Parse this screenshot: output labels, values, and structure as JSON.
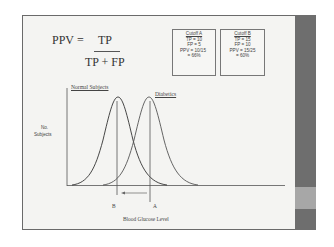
{
  "formula": {
    "lhs": "PPV",
    "equals": "=",
    "numerator": "TP",
    "denominator": "TP + FP"
  },
  "cutoff_a": {
    "title": "Cutoff A",
    "tp": "TP = 10",
    "fp": "FP = 5",
    "ppv": "PPV = 10/15",
    "result": "= 66%"
  },
  "cutoff_b": {
    "title": "Cutoff B",
    "tp": "TP = 15",
    "fp": "FP = 10",
    "ppv": "PPV = 15/25",
    "result": "= 60%"
  },
  "chart": {
    "series_normal": "Normal Subjects",
    "series_diabetics": "Diabetics",
    "ylabel_line1": "No.",
    "ylabel_line2": "Subjects",
    "xlabel": "Blood Glucose Level",
    "marker_b": "B",
    "marker_a": "A"
  },
  "colors": {
    "sidebar": "#6e6e6e",
    "sidebar_accent": "#a7a7a7",
    "slide_bg": "#f4f4f2"
  }
}
